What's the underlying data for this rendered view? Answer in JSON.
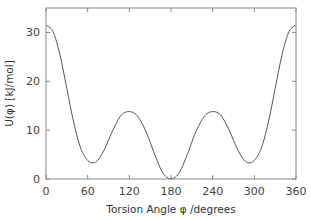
{
  "chart_data": {
    "type": "line",
    "title": "",
    "xlabel": "Torsion Angle φ /degrees",
    "ylabel": "U(φ) [kJ/mol]",
    "xlim": [
      0,
      360
    ],
    "ylim": [
      0,
      35
    ],
    "xticks": [
      0,
      60,
      120,
      180,
      240,
      300,
      360
    ],
    "xtick_labels": [
      "0",
      "60",
      "120",
      "180",
      "240",
      "300",
      "360"
    ],
    "yticks": [
      0,
      10,
      20,
      30
    ],
    "ytick_labels": [
      "0",
      "10",
      "20",
      "30"
    ],
    "grid": false,
    "legend": "none",
    "series": [
      {
        "name": "U(φ)",
        "color": "#555555",
        "x": [
          0,
          10,
          20,
          30,
          40,
          50,
          60,
          68,
          75,
          85,
          95,
          105,
          112,
          120,
          128,
          135,
          145,
          155,
          165,
          172,
          180,
          188,
          195,
          205,
          215,
          225,
          232,
          240,
          248,
          255,
          265,
          275,
          285,
          292,
          300,
          310,
          320,
          330,
          340,
          350,
          360
        ],
        "y": [
          31.5,
          30.2,
          25.5,
          18.5,
          11.5,
          6.3,
          3.8,
          3.3,
          3.9,
          6.3,
          9.6,
          12.4,
          13.5,
          13.8,
          13.4,
          12.2,
          9.4,
          5.6,
          2.1,
          0.6,
          0,
          0.6,
          2.1,
          5.6,
          9.4,
          12.2,
          13.4,
          13.8,
          13.5,
          12.4,
          9.6,
          6.3,
          3.9,
          3.3,
          3.8,
          6.3,
          11.5,
          18.5,
          25.5,
          30.2,
          31.5
        ]
      }
    ]
  }
}
